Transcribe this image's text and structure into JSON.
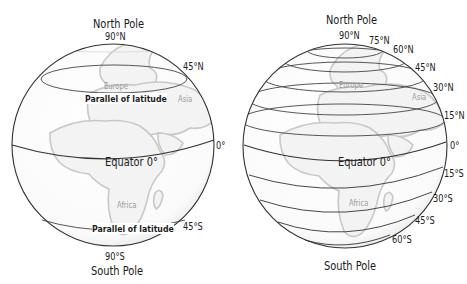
{
  "left_globe": {
    "title_top": "North Pole",
    "title_bottom": "South Pole",
    "north_pole_lat": "90°N",
    "south_pole_lat": "90°S",
    "lat_45n": "45°N",
    "lat_45s": "45°S",
    "lat_0": "0°",
    "equator_label": "Equator 0°",
    "parallel_label_north": "Parallel of latitude",
    "parallel_label_south": "Parallel of latitude",
    "regions": [
      "Europe",
      "Asia",
      "Africa"
    ]
  },
  "right_globe": {
    "title_top": "North Pole",
    "title_bottom": "South Pole",
    "lat_labels_north": [
      "90°N",
      "75°N",
      "60°N",
      "45°N",
      "30°N",
      "15°N"
    ],
    "lat_0": "0°",
    "lat_labels_south": [
      "15°S",
      "30°S",
      "45°S",
      "60°S"
    ],
    "equator_label": "Equator 0°",
    "regions": [
      "Europe",
      "Asia",
      "Africa"
    ]
  },
  "colors": {
    "outline": "#333333",
    "land": "#cfcfcf",
    "region_text": "#9a9a9a"
  }
}
